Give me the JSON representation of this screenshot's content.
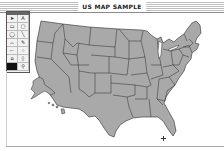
{
  "window": {
    "title": "US MAP SAMPLE"
  },
  "palette": {
    "tools": [
      {
        "name": "arrow-tool",
        "glyph": "➤"
      },
      {
        "name": "text-tool",
        "glyph": "A"
      },
      {
        "name": "rectangle-tool",
        "glyph": "▭"
      },
      {
        "name": "rounded-rectangle-tool",
        "glyph": "▢"
      },
      {
        "name": "oval-tool",
        "glyph": "◯"
      },
      {
        "name": "line-tool",
        "glyph": "╲"
      },
      {
        "name": "bucket-tool",
        "glyph": "⌓"
      },
      {
        "name": "pencil-tool",
        "glyph": "✎"
      },
      {
        "name": "brush-tool",
        "glyph": "⌐"
      },
      {
        "name": "spray-tool",
        "glyph": "⁘"
      },
      {
        "name": "polygon-tool",
        "glyph": "⌂"
      },
      {
        "name": "eraser-tool",
        "glyph": "▯"
      },
      {
        "name": "fill-pattern-swatch",
        "glyph": "",
        "selected": true
      },
      {
        "name": "zoom-tool",
        "glyph": "⚲"
      }
    ]
  },
  "map": {
    "fill": "#a9a9a9",
    "border": "#2b2b2b",
    "background": "#ffffff"
  },
  "colors": {
    "title_stripes": "#bdbdbd",
    "palette_border": "#555555",
    "selected_tool": "#111111"
  }
}
